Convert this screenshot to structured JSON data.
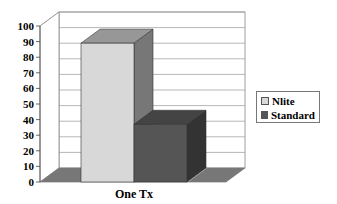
{
  "chart_data": {
    "type": "bar",
    "style": "3d-clustered-column",
    "title": "",
    "xlabel": "",
    "ylabel": "",
    "categories": [
      "One Tx"
    ],
    "series": [
      {
        "name": "Nlite",
        "values": [
          89
        ],
        "color": "#d8d8d8"
      },
      {
        "name": "Standard",
        "values": [
          37
        ],
        "color": "#555555"
      }
    ],
    "ylim": [
      0,
      100
    ],
    "yticks": [
      0,
      10,
      20,
      30,
      40,
      50,
      60,
      70,
      80,
      90,
      100
    ],
    "grid": true,
    "legend_position": "right"
  },
  "legend": {
    "items": [
      {
        "label": "Nlite",
        "color": "#d8d8d8"
      },
      {
        "label": "Standard",
        "color": "#555555"
      }
    ]
  }
}
